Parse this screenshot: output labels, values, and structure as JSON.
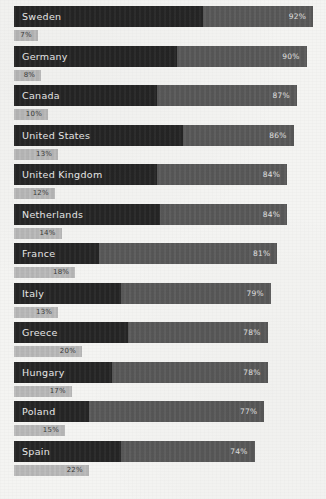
{
  "chart_data": {
    "type": "bar",
    "orientation": "horizontal",
    "title": "",
    "xlabel": "",
    "ylabel": "",
    "xlim": [
      0,
      100
    ],
    "grid": false,
    "legend": null,
    "categories": [
      "Sweden",
      "Germany",
      "Canada",
      "United States",
      "United Kingdom",
      "Netherlands",
      "France",
      "Italy",
      "Greece",
      "Hungary",
      "Poland",
      "Spain"
    ],
    "series": [
      {
        "name": "primary",
        "values": [
          92,
          90,
          87,
          86,
          84,
          84,
          81,
          79,
          78,
          78,
          77,
          74
        ],
        "labels": [
          "92%",
          "90%",
          "87%",
          "86%",
          "84%",
          "84%",
          "81%",
          "79%",
          "78%",
          "78%",
          "77%",
          "74%"
        ]
      },
      {
        "name": "secondary",
        "values": [
          7,
          8,
          10,
          13,
          12,
          14,
          18,
          13,
          20,
          17,
          15,
          22
        ],
        "labels": [
          "7%",
          "8%",
          "10%",
          "13%",
          "12%",
          "14%",
          "18%",
          "13%",
          "20%",
          "17%",
          "15%",
          "22%"
        ]
      }
    ],
    "inner_segment_values": [
      58,
      50,
      44,
      52,
      44,
      45,
      26,
      33,
      35,
      30,
      23,
      33
    ],
    "colors": {
      "background": "#f4f4f2",
      "bar_primary": "#5a5a5a",
      "bar_primary_inner": "#262626",
      "bar_secondary": "#b9b9b9",
      "primary_label_text": "#e9e9e9",
      "secondary_label_text": "#3a3a3a"
    },
    "rows": [
      {
        "label": "Sweden",
        "value": 92,
        "value_label": "92%",
        "inner": 58,
        "sub_value": 7,
        "sub_label": "7%"
      },
      {
        "label": "Germany",
        "value": 90,
        "value_label": "90%",
        "inner": 50,
        "sub_value": 8,
        "sub_label": "8%"
      },
      {
        "label": "Canada",
        "value": 87,
        "value_label": "87%",
        "inner": 44,
        "sub_value": 10,
        "sub_label": "10%"
      },
      {
        "label": "United States",
        "value": 86,
        "value_label": "86%",
        "inner": 52,
        "sub_value": 13,
        "sub_label": "13%"
      },
      {
        "label": "United Kingdom",
        "value": 84,
        "value_label": "84%",
        "inner": 44,
        "sub_value": 12,
        "sub_label": "12%"
      },
      {
        "label": "Netherlands",
        "value": 84,
        "value_label": "84%",
        "inner": 45,
        "sub_value": 14,
        "sub_label": "14%"
      },
      {
        "label": "France",
        "value": 81,
        "value_label": "81%",
        "inner": 26,
        "sub_value": 18,
        "sub_label": "18%"
      },
      {
        "label": "Italy",
        "value": 79,
        "value_label": "79%",
        "inner": 33,
        "sub_value": 13,
        "sub_label": "13%"
      },
      {
        "label": "Greece",
        "value": 78,
        "value_label": "78%",
        "inner": 35,
        "sub_value": 20,
        "sub_label": "20%"
      },
      {
        "label": "Hungary",
        "value": 78,
        "value_label": "78%",
        "inner": 30,
        "sub_value": 17,
        "sub_label": "17%"
      },
      {
        "label": "Poland",
        "value": 77,
        "value_label": "77%",
        "inner": 23,
        "sub_value": 15,
        "sub_label": "15%"
      },
      {
        "label": "Spain",
        "value": 74,
        "value_label": "74%",
        "inner": 33,
        "sub_value": 22,
        "sub_label": "22%"
      }
    ]
  }
}
